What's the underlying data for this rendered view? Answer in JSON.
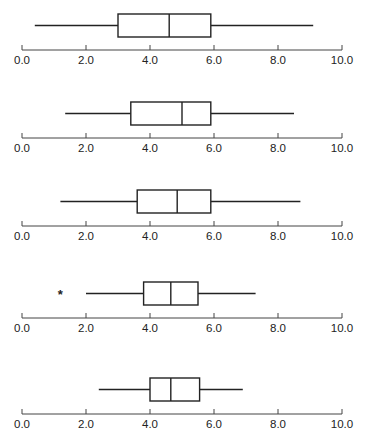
{
  "chart_data": [
    {
      "type": "boxplot",
      "title": "",
      "xlabel": "",
      "ylabel": "",
      "xlim": [
        0.0,
        10.0
      ],
      "ticks": [
        "0.0",
        "2.0",
        "4.0",
        "6.0",
        "8.0",
        "10.0"
      ],
      "grid": false,
      "stats": {
        "min": 0.4,
        "q1": 3.0,
        "median": 4.6,
        "q3": 5.9,
        "max": 9.1
      },
      "outliers": []
    },
    {
      "type": "boxplot",
      "title": "",
      "xlabel": "",
      "ylabel": "",
      "xlim": [
        0.0,
        10.0
      ],
      "ticks": [
        "0.0",
        "2.0",
        "4.0",
        "6.0",
        "8.0",
        "10.0"
      ],
      "grid": false,
      "stats": {
        "min": 1.35,
        "q1": 3.4,
        "median": 5.0,
        "q3": 5.9,
        "max": 8.5
      },
      "outliers": []
    },
    {
      "type": "boxplot",
      "title": "",
      "xlabel": "",
      "ylabel": "",
      "xlim": [
        0.0,
        10.0
      ],
      "ticks": [
        "0.0",
        "2.0",
        "4.0",
        "6.0",
        "8.0",
        "10.0"
      ],
      "grid": false,
      "stats": {
        "min": 1.2,
        "q1": 3.6,
        "median": 4.85,
        "q3": 5.9,
        "max": 8.7
      },
      "outliers": []
    },
    {
      "type": "boxplot",
      "title": "",
      "xlabel": "",
      "ylabel": "",
      "xlim": [
        0.0,
        10.0
      ],
      "ticks": [
        "0.0",
        "2.0",
        "4.0",
        "6.0",
        "8.0",
        "10.0"
      ],
      "grid": false,
      "stats": {
        "min": 2.0,
        "q1": 3.8,
        "median": 4.65,
        "q3": 5.5,
        "max": 7.3
      },
      "outliers": [
        1.2
      ],
      "outlier_marker": "*"
    },
    {
      "type": "boxplot",
      "title": "",
      "xlabel": "",
      "ylabel": "",
      "xlim": [
        0.0,
        10.0
      ],
      "ticks": [
        "0.0",
        "2.0",
        "4.0",
        "6.0",
        "8.0",
        "10.0"
      ],
      "grid": false,
      "stats": {
        "min": 2.4,
        "q1": 4.0,
        "median": 4.65,
        "q3": 5.55,
        "max": 6.9
      },
      "outliers": []
    }
  ],
  "layout": {
    "panel_tops": [
      0,
      88,
      176,
      268,
      364
    ],
    "axis_x0": 22,
    "axis_x1": 342,
    "line_color": "#222222"
  }
}
